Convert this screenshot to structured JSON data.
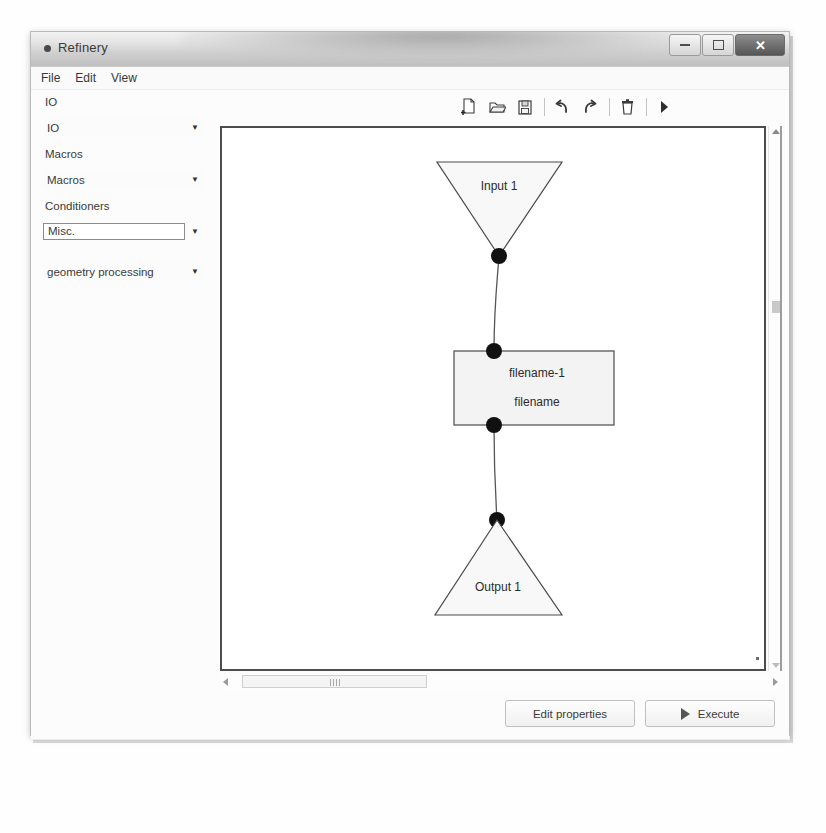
{
  "window": {
    "title": "Refinery",
    "app_icon": "app-dot-icon",
    "controls": {
      "minimize": "minimize-icon",
      "maximize": "maximize-icon",
      "close": "✕"
    }
  },
  "menubar": {
    "items": [
      {
        "label": "File"
      },
      {
        "label": "Edit"
      },
      {
        "label": "View"
      }
    ]
  },
  "sidebar": {
    "groups": [
      {
        "label": "IO",
        "value": "IO",
        "focused": false
      },
      {
        "label": "Macros",
        "value": "Macros",
        "focused": false
      },
      {
        "label": "Conditioners",
        "value": "Misc.",
        "focused": true
      }
    ],
    "extra_combo": {
      "value": "geometry processing",
      "focused": false
    }
  },
  "toolbar": {
    "buttons": [
      {
        "name": "new-file-icon",
        "title": "New"
      },
      {
        "name": "open-file-icon",
        "title": "Open"
      },
      {
        "name": "save-file-icon",
        "title": "Save"
      },
      {
        "name": "undo-icon",
        "title": "Undo"
      },
      {
        "name": "redo-icon",
        "title": "Redo"
      },
      {
        "name": "delete-icon",
        "title": "Delete"
      },
      {
        "name": "run-icon",
        "title": "Run"
      }
    ]
  },
  "canvas": {
    "nodes": [
      {
        "id": "input-1",
        "type": "input-triangle",
        "label": "Input 1"
      },
      {
        "id": "filename",
        "type": "process-box",
        "label_line1": "filename-1",
        "label_line2": "filename"
      },
      {
        "id": "output-1",
        "type": "output-triangle",
        "label": "Output 1"
      }
    ]
  },
  "footer": {
    "edit_properties_label": "Edit properties",
    "execute_label": "Execute"
  },
  "colors": {
    "canvas_border": "#4d4d4d",
    "node_fill": "#f7f7f7",
    "node_stroke": "#4a4a4a",
    "connector_dot": "#111111"
  }
}
